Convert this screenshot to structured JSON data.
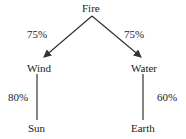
{
  "diagram": {
    "type": "tree",
    "nodes": {
      "root": "Fire",
      "left": "Wind",
      "right": "Water",
      "left_child": "Sun",
      "right_child": "Earth"
    },
    "edges": [
      {
        "from": "Fire",
        "to": "Wind",
        "label": "75%",
        "arrow": true
      },
      {
        "from": "Fire",
        "to": "Water",
        "label": "75%",
        "arrow": true
      },
      {
        "from": "Wind",
        "to": "Sun",
        "label": "80%",
        "arrow": false
      },
      {
        "from": "Water",
        "to": "Earth",
        "label": "60%",
        "arrow": false
      }
    ],
    "colors": {
      "line": "#333333",
      "text": "#1a1a1a",
      "background": "#ffffff"
    }
  }
}
